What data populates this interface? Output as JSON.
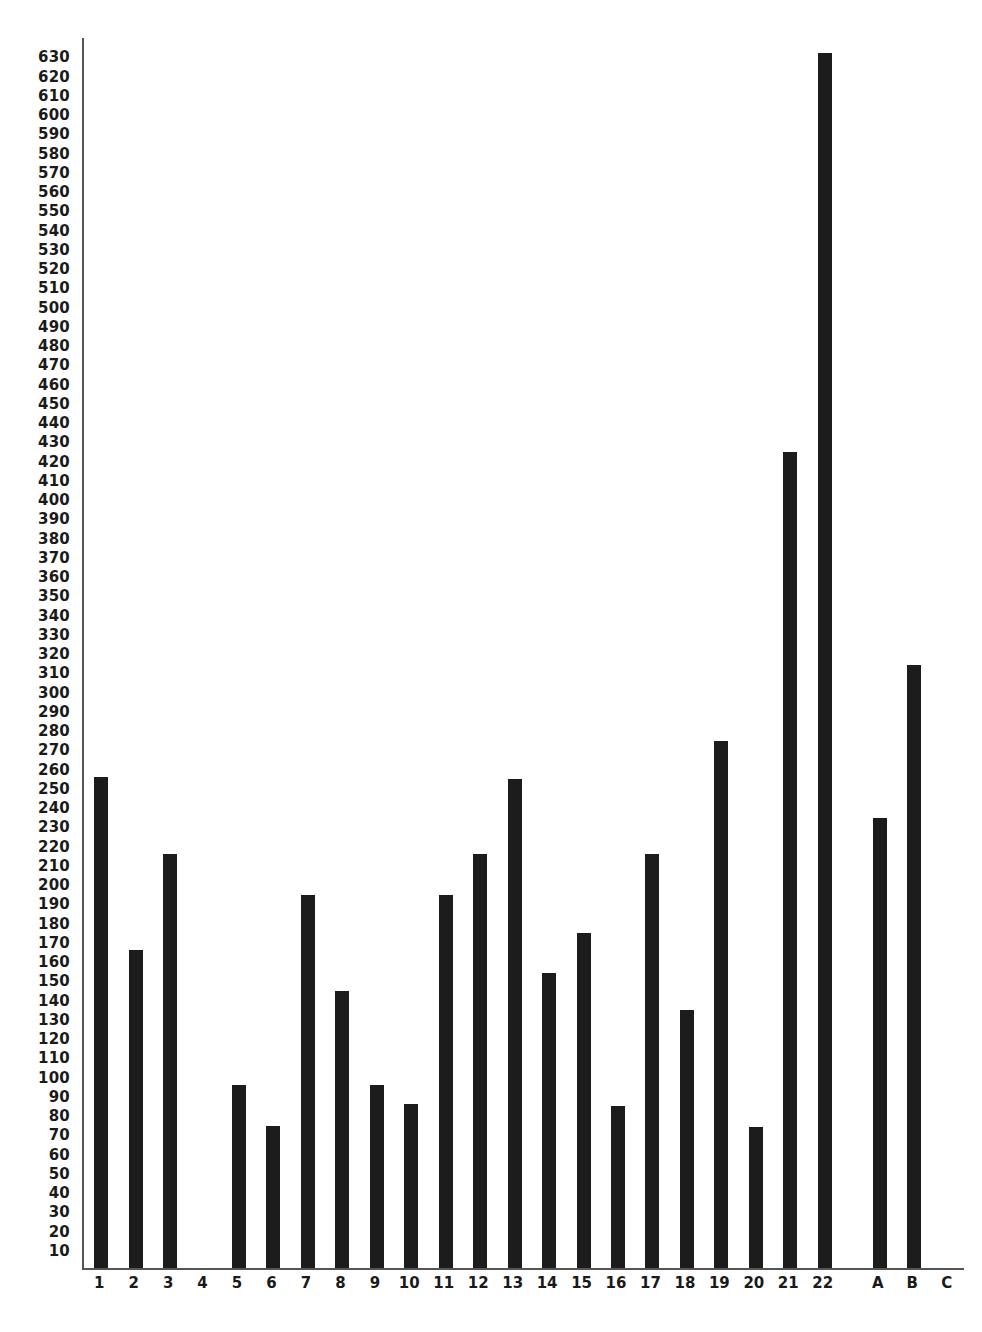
{
  "chart_data": {
    "type": "bar",
    "title": "",
    "subtitle": "",
    "xlabel": "",
    "ylabel": "",
    "grid": false,
    "legend": null,
    "orientation": "vertical",
    "bar_color": "#1c1c1c",
    "axis_color": "#555555",
    "background": "#ffffff",
    "ylim": [
      0,
      640
    ],
    "ytick_step": 10,
    "yticks": [
      630,
      620,
      610,
      600,
      590,
      580,
      570,
      560,
      550,
      540,
      530,
      520,
      510,
      500,
      490,
      480,
      470,
      460,
      450,
      440,
      430,
      420,
      410,
      400,
      390,
      380,
      370,
      360,
      350,
      340,
      330,
      320,
      310,
      300,
      290,
      280,
      270,
      260,
      250,
      240,
      230,
      220,
      210,
      200,
      190,
      180,
      170,
      160,
      150,
      140,
      130,
      120,
      110,
      100,
      90,
      80,
      70,
      60,
      50,
      40,
      30,
      20,
      10
    ],
    "categories": [
      "1",
      "2",
      "3",
      "4",
      "5",
      "6",
      "7",
      "8",
      "9",
      "10",
      "11",
      "12",
      "13",
      "14",
      "15",
      "16",
      "17",
      "18",
      "19",
      "20",
      "21",
      "22",
      "A",
      "B",
      "C"
    ],
    "values": [
      255,
      165,
      215,
      0,
      95,
      74,
      194,
      144,
      95,
      85,
      194,
      215,
      254,
      153,
      174,
      84,
      215,
      134,
      274,
      73,
      424,
      631,
      234,
      313,
      0
    ],
    "group_gap_after": "22"
  }
}
